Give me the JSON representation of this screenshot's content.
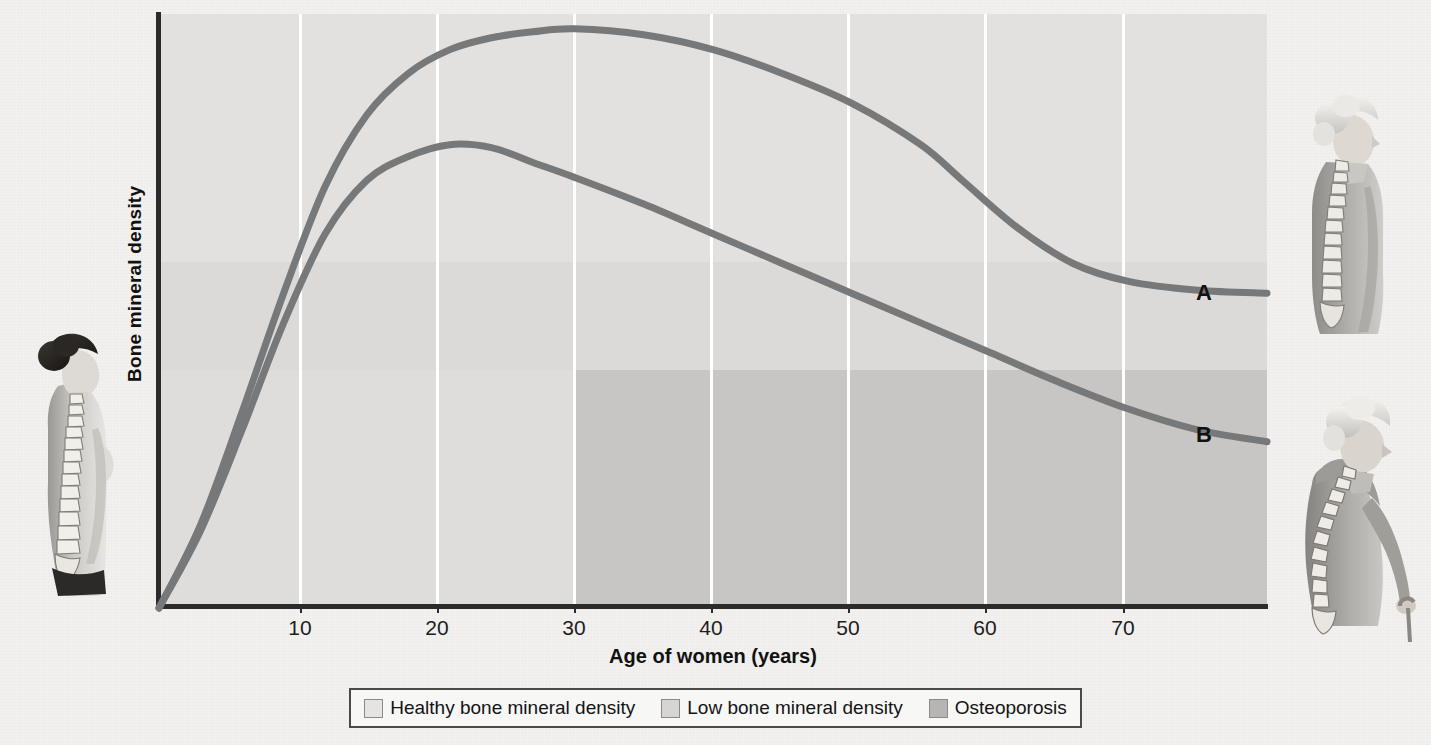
{
  "chart_data": {
    "type": "line",
    "title": "",
    "xlabel": "Age of women (years)",
    "ylabel": "Bone mineral density",
    "xlim": [
      0,
      80
    ],
    "ylim": [
      0,
      100
    ],
    "xticks": [
      10,
      20,
      30,
      40,
      50,
      60,
      70
    ],
    "xticklabels": [
      "10",
      "20",
      "30",
      "40",
      "50",
      "60",
      "70"
    ],
    "yticks": [],
    "yticklabels": [],
    "grid": "vertical-only",
    "legend_position": "below-plot",
    "annotations": [
      {
        "text": "A",
        "x": 73,
        "y": 55,
        "note": "label for upper curve"
      },
      {
        "text": "B",
        "x": 73,
        "y": 31,
        "note": "label for lower curve"
      }
    ],
    "bands": [
      {
        "name": "Healthy bone mineral density",
        "color": "#e2e1df",
        "y_range": [
          58,
          100
        ],
        "x_range": [
          0,
          80
        ]
      },
      {
        "name": "Low bone mineral density",
        "color": "#dbdad8",
        "y_range": [
          40,
          58
        ],
        "x_range": [
          0,
          80
        ]
      },
      {
        "name": "Osteoporosis",
        "color": "#c7c6c4",
        "y_range": [
          0,
          40
        ],
        "x_range": [
          30,
          80
        ]
      }
    ],
    "series": [
      {
        "name": "A",
        "label": "A",
        "color": "#77787a",
        "x": [
          0,
          3,
          6,
          9,
          12,
          15,
          18,
          21,
          24,
          27,
          30,
          35,
          40,
          45,
          50,
          55,
          58,
          62,
          66,
          70,
          75,
          80
        ],
        "y": [
          0,
          14,
          33,
          53,
          71,
          83,
          90,
          94,
          96,
          97,
          97.5,
          96.5,
          94,
          90,
          85,
          78,
          72,
          64,
          58,
          55,
          53.5,
          53
        ]
      },
      {
        "name": "B",
        "label": "B",
        "color": "#77787a",
        "x": [
          0,
          3,
          6,
          9,
          12,
          15,
          18,
          21,
          24,
          27,
          30,
          35,
          40,
          45,
          50,
          55,
          60,
          65,
          70,
          75,
          80
        ],
        "y": [
          0,
          13,
          30,
          48,
          63,
          72,
          76,
          78,
          77.5,
          75,
          72.5,
          68,
          63,
          58,
          53,
          48,
          43,
          38,
          33.5,
          30,
          28
        ]
      }
    ]
  },
  "axes": {
    "x_title": "Age of women (years)",
    "y_title": "Bone mineral density",
    "x_tick_labels": [
      "10",
      "20",
      "30",
      "40",
      "50",
      "60",
      "70"
    ]
  },
  "curve_labels": {
    "a": "A",
    "b": "B"
  },
  "legend": {
    "items": [
      {
        "label": "Healthy bone mineral density",
        "color": "#e5e4e2"
      },
      {
        "label": "Low bone mineral density",
        "color": "#d6d5d3"
      },
      {
        "label": "Osteoporosis",
        "color": "#b6b5b3"
      }
    ]
  },
  "figures": {
    "left": {
      "name": "young-woman-spine-illustration",
      "alt": "Young woman in profile with spine visible"
    },
    "right_top": {
      "name": "older-woman-spine-illustration",
      "alt": "Older woman in profile with slight spinal curvature"
    },
    "right_bottom": {
      "name": "elderly-woman-kyphosis-illustration",
      "alt": "Elderly woman in profile with severe kyphosis using a cane"
    }
  },
  "colors": {
    "band_healthy": "#e2e1df",
    "band_low": "#dbdad8",
    "band_osteoporosis": "#c7c6c4",
    "curve": "#77787a",
    "axis": "#2b2b2b",
    "gridline": "#ffffff",
    "page_background": "#f2f1ef"
  }
}
